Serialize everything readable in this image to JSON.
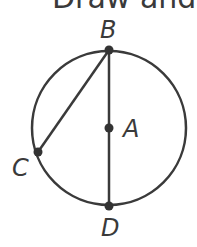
{
  "title_fragment": "Draw and la",
  "diagram": {
    "circle": {
      "cx": 109,
      "cy": 128,
      "r": 77,
      "stroke": "#3a3a3a"
    },
    "points": [
      {
        "name": "B",
        "x": 109,
        "y": 50
      },
      {
        "name": "A",
        "x": 109,
        "y": 128
      },
      {
        "name": "C",
        "x": 38,
        "y": 152
      },
      {
        "name": "D",
        "x": 109,
        "y": 206
      }
    ],
    "segments": [
      {
        "from": "B",
        "to": "D",
        "label": "diameter BD"
      },
      {
        "from": "B",
        "to": "C",
        "label": "chord BC"
      }
    ],
    "labels": {
      "B": "B",
      "A": "A",
      "C": "C",
      "D": "D"
    }
  }
}
